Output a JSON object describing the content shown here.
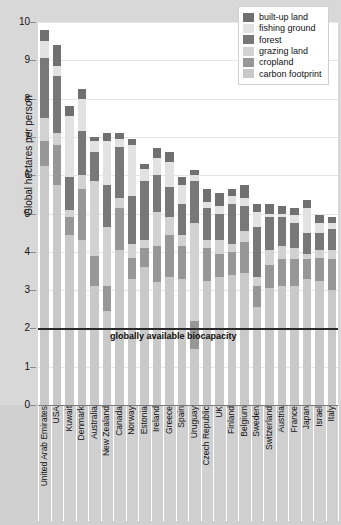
{
  "chart_data": {
    "type": "bar",
    "stacked": true,
    "title": "",
    "xlabel": "",
    "ylabel": "Global hectares per person",
    "ylim": [
      0,
      10
    ],
    "ytick_labels": [
      "0",
      "1",
      "2",
      "3",
      "4",
      "5",
      "6",
      "7",
      "8",
      "9",
      "10"
    ],
    "grid": true,
    "legend_position": "top-right",
    "categories": [
      "United Arab Emirates",
      "USA",
      "Kuwait",
      "Denmark",
      "Australia",
      "New Zealand",
      "Canada",
      "Norway",
      "Estonia",
      "Ireland",
      "Greece",
      "Spain",
      "Uruguay",
      "Czech Republic",
      "UK",
      "Finland",
      "Belgium",
      "Sweden",
      "Switzerland",
      "Austria",
      "France",
      "Japan",
      "Israel",
      "Italy"
    ],
    "series": [
      {
        "name": "carbon footprint",
        "color": "#c9c9c9",
        "values": [
          6.25,
          5.75,
          4.45,
          4.3,
          3.1,
          2.45,
          4.05,
          3.3,
          3.6,
          3.2,
          3.35,
          3.3,
          1.45,
          3.25,
          3.35,
          3.4,
          3.45,
          2.55,
          3.05,
          3.1,
          3.1,
          3.3,
          3.25,
          3.0
        ]
      },
      {
        "name": "cropland",
        "color": "#979797",
        "values": [
          0.65,
          1.05,
          0.45,
          1.35,
          0.8,
          0.65,
          1.1,
          0.55,
          0.5,
          0.95,
          1.1,
          0.85,
          0.75,
          0.85,
          0.6,
          0.6,
          0.8,
          0.55,
          0.6,
          0.7,
          0.7,
          0.5,
          0.6,
          0.8
        ]
      },
      {
        "name": "grazing land",
        "color": "#d2d2d2",
        "values": [
          0.6,
          0.3,
          0.2,
          0.35,
          1.95,
          1.55,
          0.25,
          0.35,
          0.2,
          0.9,
          0.45,
          0.3,
          2.55,
          0.2,
          0.35,
          0.2,
          0.3,
          0.25,
          0.4,
          0.35,
          0.3,
          0.15,
          0.2,
          0.25
        ]
      },
      {
        "name": "forest",
        "color": "#787878",
        "values": [
          1.55,
          1.5,
          0.85,
          1.15,
          0.75,
          1.1,
          1.35,
          1.25,
          1.55,
          0.95,
          0.8,
          0.8,
          1.1,
          0.85,
          0.7,
          1.05,
          0.65,
          1.3,
          0.85,
          0.75,
          0.65,
          0.55,
          0.45,
          0.55
        ]
      },
      {
        "name": "fishing ground",
        "color": "#e2e2e2",
        "values": [
          0.45,
          0.25,
          1.6,
          0.85,
          0.3,
          1.15,
          0.2,
          1.35,
          0.3,
          0.45,
          0.65,
          0.5,
          0.15,
          0.15,
          0.2,
          0.2,
          0.2,
          0.4,
          0.1,
          0.1,
          0.2,
          0.65,
          0.25,
          0.15
        ]
      },
      {
        "name": "built-up land",
        "color": "#707070",
        "values": [
          0.3,
          0.55,
          0.25,
          0.25,
          0.1,
          0.2,
          0.15,
          0.15,
          0.15,
          0.25,
          0.25,
          0.2,
          0.15,
          0.35,
          0.35,
          0.2,
          0.35,
          0.2,
          0.25,
          0.2,
          0.2,
          0.2,
          0.2,
          0.15
        ]
      }
    ],
    "annotations": [
      {
        "name": "globally-available-biocapacity",
        "label": "globally available biocapacity",
        "y": 2.0,
        "type": "hline"
      }
    ]
  },
  "legend": {
    "items": [
      {
        "label": "built-up land",
        "color": "#707070"
      },
      {
        "label": "fishing ground",
        "color": "#e2e2e2"
      },
      {
        "label": "forest",
        "color": "#787878"
      },
      {
        "label": "grazing land",
        "color": "#d2d2d2"
      },
      {
        "label": "cropland",
        "color": "#979797"
      },
      {
        "label": "carbon footprint",
        "color": "#c9c9c9"
      }
    ]
  }
}
